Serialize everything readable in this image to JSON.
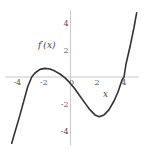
{
  "chart_data": {
    "type": "line",
    "title": "",
    "xlabel": "x",
    "ylabel": "f′(x)",
    "xlim": [
      -5,
      5
    ],
    "ylim": [
      -5,
      5
    ],
    "grid": false,
    "legend": null,
    "x_ticks": [
      -4,
      -2,
      0,
      2,
      4
    ],
    "y_ticks": [
      4,
      2,
      -2,
      -4
    ],
    "x_tick_labels": [
      "-4",
      "-2",
      "0",
      "2",
      "4"
    ],
    "y_tick_labels": [
      "4",
      "2",
      "-2",
      "-4"
    ],
    "series": [
      {
        "name": "f′(x)",
        "color": "#333333",
        "x": [
          -4.42,
          -3.8,
          -3.22,
          -2.92,
          -2.67,
          -2.29,
          -1.92,
          -1.54,
          -1.17,
          -0.79,
          -0.41,
          -0.04,
          0.34,
          0.71,
          1.09,
          1.47,
          1.84,
          2.17,
          2.52,
          2.89,
          3.27,
          3.57,
          3.87,
          4.02,
          4.17,
          4.47,
          4.77,
          4.98
        ],
        "y": [
          -4.91,
          -2.81,
          -0.72,
          0.0,
          0.3,
          0.56,
          0.64,
          0.59,
          0.44,
          0.22,
          -0.07,
          -0.44,
          -0.89,
          -1.41,
          -1.93,
          -2.44,
          -2.81,
          -2.94,
          -2.81,
          -2.44,
          -1.78,
          -1.11,
          -0.22,
          0.0,
          0.96,
          2.24,
          3.63,
          4.76
        ]
      }
    ],
    "annotations": [
      {
        "text": "f′(x)",
        "x": -2.0,
        "y": 2.4
      },
      {
        "text": "x",
        "x": 2.6,
        "y": -1.2
      }
    ]
  },
  "labels": {
    "ylabel": "f′(x)",
    "xlabel": "x"
  },
  "colors": {
    "curve": "#333333",
    "axis": "#c8c8c8",
    "tick_text": "#555555"
  }
}
